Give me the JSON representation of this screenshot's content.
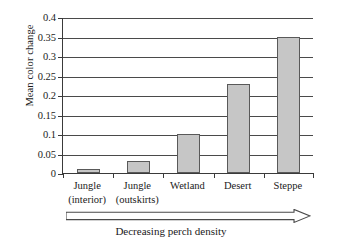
{
  "chart_data": {
    "type": "bar",
    "title": "",
    "categories": [
      "Jungle (interior)",
      "Jungle (outskirts)",
      "Wetland",
      "Desert",
      "Steppe"
    ],
    "category_lines": [
      [
        "Jungle",
        "(interior)"
      ],
      [
        "Jungle",
        "(outskirts)"
      ],
      [
        "Wetland"
      ],
      [
        "Desert"
      ],
      [
        "Steppe"
      ]
    ],
    "values": [
      0.01,
      0.03,
      0.1,
      0.228,
      0.35
    ],
    "xlabel": "Decreasing perch density",
    "ylabel": "Mean color change",
    "ylim": [
      0,
      0.4
    ],
    "ytick_labels": [
      "0",
      "0.05",
      "0.1",
      "0.15",
      "0.2",
      "0.25",
      "0.3",
      "0.35",
      "0.4"
    ],
    "ytick_values": [
      0,
      0.05,
      0.1,
      0.15,
      0.2,
      0.25,
      0.3,
      0.35,
      0.4
    ],
    "grid": true,
    "legend": false,
    "bar_color": "#c6c6c6",
    "bar_border_color": "#595959",
    "axis_color": "#3a3a3a",
    "grid_color": "#4a4a4a",
    "annotation": {
      "arrow_direction": "right",
      "arrow_style": "hollow-outline",
      "caption": "Decreasing perch density"
    }
  }
}
